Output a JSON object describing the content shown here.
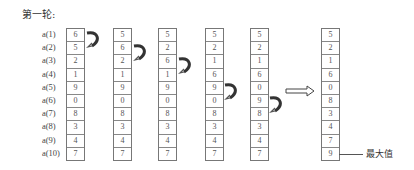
{
  "title": "第一轮:",
  "row_labels": [
    "a(1)",
    "a(2)",
    "a(3)",
    "a(4)",
    "a(5)",
    "a(6)",
    "a(7)",
    "a(8)",
    "a(9)",
    "a(10)"
  ],
  "columns": [
    {
      "values": [
        "6",
        "5",
        "2",
        "1",
        "9",
        "0",
        "8",
        "3",
        "4",
        "7"
      ]
    },
    {
      "values": [
        "5",
        "6",
        "2",
        "1",
        "9",
        "0",
        "8",
        "3",
        "4",
        "7"
      ]
    },
    {
      "values": [
        "5",
        "2",
        "6",
        "1",
        "9",
        "0",
        "8",
        "3",
        "4",
        "7"
      ]
    },
    {
      "values": [
        "5",
        "2",
        "1",
        "6",
        "9",
        "0",
        "8",
        "3",
        "4",
        "7"
      ]
    },
    {
      "values": [
        "5",
        "2",
        "1",
        "6",
        "0",
        "9",
        "8",
        "3",
        "4",
        "7"
      ]
    },
    {
      "values": [
        "5",
        "2",
        "1",
        "6",
        "0",
        "8",
        "3",
        "4",
        "7",
        "9"
      ]
    }
  ],
  "swaps": [
    {
      "column": 1,
      "rows": [
        1,
        2
      ]
    },
    {
      "column": 2,
      "rows": [
        2,
        3
      ]
    },
    {
      "column": 3,
      "rows": [
        3,
        4
      ]
    },
    {
      "column": 4,
      "rows": [
        5,
        6
      ]
    },
    {
      "column": 5,
      "rows": [
        6,
        7
      ]
    }
  ],
  "result_arrow": "right-arrow",
  "max_label": "最大值"
}
